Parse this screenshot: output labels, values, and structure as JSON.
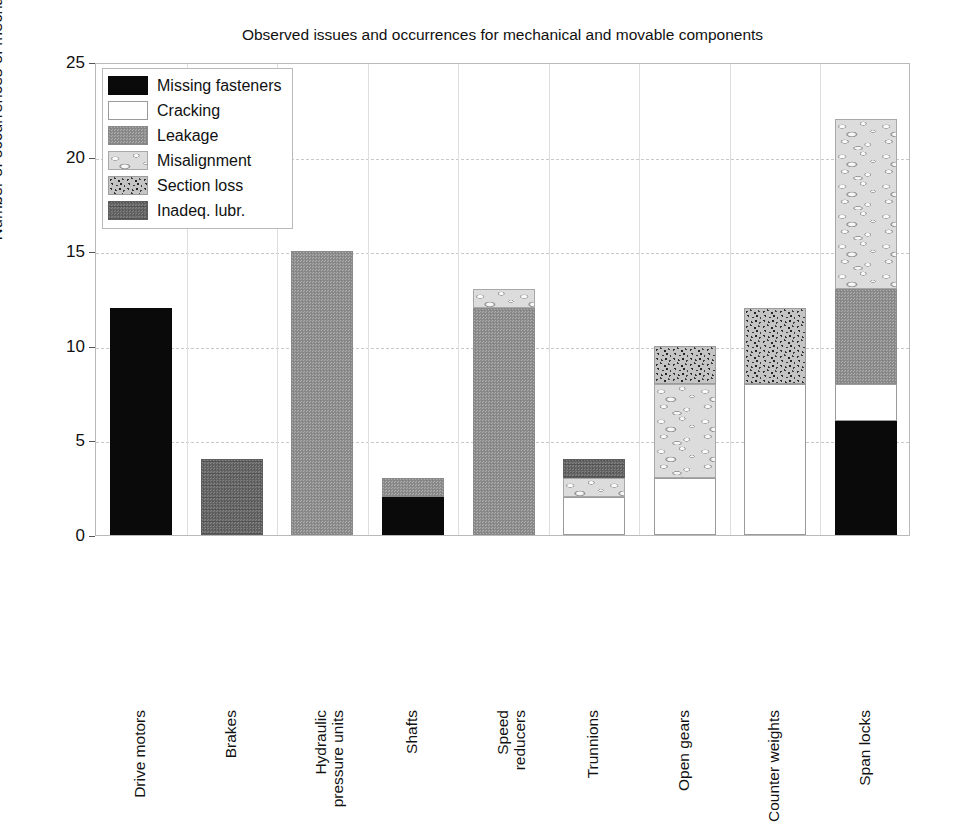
{
  "chart_data": {
    "type": "bar",
    "stacked": true,
    "title": "Observed issues and occurrences for mechanical and movable components",
    "xlabel": "",
    "ylabel": "Number of occurrences of mechanical problems",
    "ylim": [
      0,
      25
    ],
    "yticks": [
      0,
      5,
      10,
      15,
      20,
      25
    ],
    "grid": "horizontal-dashed-and-vertical-category-lines",
    "legend_position": "upper-left-inside",
    "categories": [
      "Drive motors",
      "Brakes",
      "Hydraulic pressure units",
      "Shafts",
      "Speed reducers",
      "Trunnions",
      "Open gears",
      "Counter weights",
      "Span locks"
    ],
    "category_lines": [
      [
        "Drive motors",
        ""
      ],
      [
        "Brakes",
        ""
      ],
      [
        "Hydraulic",
        "pressure units"
      ],
      [
        "Shafts",
        ""
      ],
      [
        "Speed",
        "reducers"
      ],
      [
        "Trunnions",
        ""
      ],
      [
        "Open gears",
        ""
      ],
      [
        "Counter weights",
        ""
      ],
      [
        "Span locks",
        ""
      ]
    ],
    "series": [
      {
        "name": "Missing fasteners",
        "key": "missing-fasteners",
        "values": [
          12,
          0,
          0,
          2,
          0,
          0,
          0,
          0,
          6
        ]
      },
      {
        "name": "Cracking",
        "key": "cracking",
        "values": [
          0,
          0,
          0,
          0,
          0,
          2,
          3,
          8,
          2
        ]
      },
      {
        "name": "Leakage",
        "key": "leakage",
        "values": [
          0,
          0,
          15,
          1,
          12,
          0,
          0,
          0,
          5
        ]
      },
      {
        "name": "Misalignment",
        "key": "misalignment",
        "values": [
          0,
          0,
          0,
          0,
          1,
          1,
          5,
          0,
          9
        ]
      },
      {
        "name": "Section loss",
        "key": "section-loss",
        "values": [
          0,
          0,
          0,
          0,
          0,
          0,
          2,
          4,
          0
        ]
      },
      {
        "name": "Inadeq. lubr.",
        "key": "inadeq-lubr",
        "values": [
          0,
          4,
          0,
          0,
          0,
          1,
          0,
          0,
          0
        ]
      }
    ],
    "totals": [
      12,
      4,
      15,
      3,
      13,
      4,
      10,
      12,
      22
    ]
  },
  "legend": {
    "items": [
      {
        "label": "Missing fasteners",
        "key": "missing-fasteners",
        "color": "#0a0a0a"
      },
      {
        "label": "Cracking",
        "key": "cracking",
        "color": "#ffffff"
      },
      {
        "label": "Leakage",
        "key": "leakage",
        "color": "#8f8f8f"
      },
      {
        "label": "Misalignment",
        "key": "misalignment",
        "color": "#d8d8d8"
      },
      {
        "label": "Section loss",
        "key": "section-loss",
        "color": "#b0b0b0"
      },
      {
        "label": "Inadeq. lubr.",
        "key": "inadeq-lubr",
        "color": "#6b6b6b"
      }
    ]
  }
}
